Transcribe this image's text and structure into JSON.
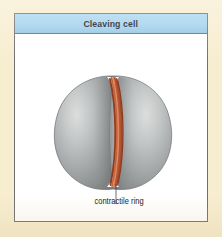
{
  "figure": {
    "title": "Cleaving cell",
    "background_color": "#f7edcf",
    "panel_background_color": "#ffffff",
    "panel_border_color": "#6e6e72",
    "header_color": "#a9d6ef",
    "title_color": "#11161f"
  },
  "diagram": {
    "cell": {
      "name": "dividing-cell",
      "fill_light": "#d6d8d8",
      "fill_mid": "#a7aaab",
      "fill_dark": "#7c7f80",
      "outline": "#6a6d6e",
      "left_lobe_name": "left-daughter-lobe",
      "right_lobe_name": "right-daughter-lobe"
    },
    "contractile_ring": {
      "name": "contractile-ring",
      "strand_colors": [
        "#a8472a",
        "#c4643a",
        "#e0865a",
        "#b9552f",
        "#8f3b22"
      ],
      "strand_count": 5
    },
    "callout": {
      "label": "contractile ring",
      "leader_color": "#4a4a4a",
      "label_color": "#141414"
    }
  }
}
